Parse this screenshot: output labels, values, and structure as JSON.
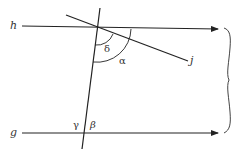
{
  "diagram": {
    "type": "geometry",
    "lines": {
      "h": "h",
      "g": "g",
      "j": "j"
    },
    "angles": {
      "alpha": "α",
      "beta": "β",
      "gamma": "γ",
      "delta": "δ"
    },
    "colors": {
      "stroke": "#222222",
      "text": "#333333"
    }
  }
}
